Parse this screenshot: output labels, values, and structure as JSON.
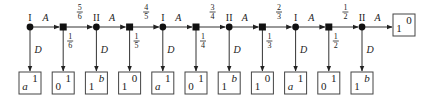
{
  "diagram": {
    "type": "game-tree",
    "main_nodes": [
      {
        "kind": "player",
        "label": "I",
        "action": "A",
        "down_label": "D",
        "payoff": {
          "bottom_left": "a",
          "top_right": "1"
        }
      },
      {
        "kind": "chance",
        "label": "",
        "right_prob": "5/6",
        "down_prob": "1/6",
        "payoff": {
          "bottom_left": "0",
          "top_right": "1"
        }
      },
      {
        "kind": "player",
        "label": "II",
        "action": "A",
        "down_label": "D",
        "payoff": {
          "bottom_left": "1",
          "top_right": "b"
        }
      },
      {
        "kind": "chance",
        "label": "",
        "right_prob": "4/5",
        "down_prob": "1/5",
        "payoff": {
          "bottom_left": "1",
          "top_right": "0"
        }
      },
      {
        "kind": "player",
        "label": "I",
        "action": "A",
        "down_label": "D",
        "payoff": {
          "bottom_left": "a",
          "top_right": "1"
        }
      },
      {
        "kind": "chance",
        "label": "",
        "right_prob": "3/4",
        "down_prob": "1/4",
        "payoff": {
          "bottom_left": "0",
          "top_right": "1"
        }
      },
      {
        "kind": "player",
        "label": "II",
        "action": "A",
        "down_label": "D",
        "payoff": {
          "bottom_left": "1",
          "top_right": "b"
        }
      },
      {
        "kind": "chance",
        "label": "",
        "right_prob": "2/3",
        "down_prob": "1/3",
        "payoff": {
          "bottom_left": "1",
          "top_right": "0"
        }
      },
      {
        "kind": "player",
        "label": "I",
        "action": "A",
        "down_label": "D",
        "payoff": {
          "bottom_left": "a",
          "top_right": "1"
        }
      },
      {
        "kind": "chance",
        "label": "",
        "right_prob": "1/2",
        "down_prob": "1/2",
        "payoff": {
          "bottom_left": "0",
          "top_right": "1"
        }
      },
      {
        "kind": "player",
        "label": "II",
        "action": "A",
        "down_label": "D",
        "payoff": {
          "bottom_left": "1",
          "top_right": "b"
        }
      }
    ],
    "terminal_payoff": {
      "bottom_left": "1",
      "top_right": "0"
    }
  }
}
